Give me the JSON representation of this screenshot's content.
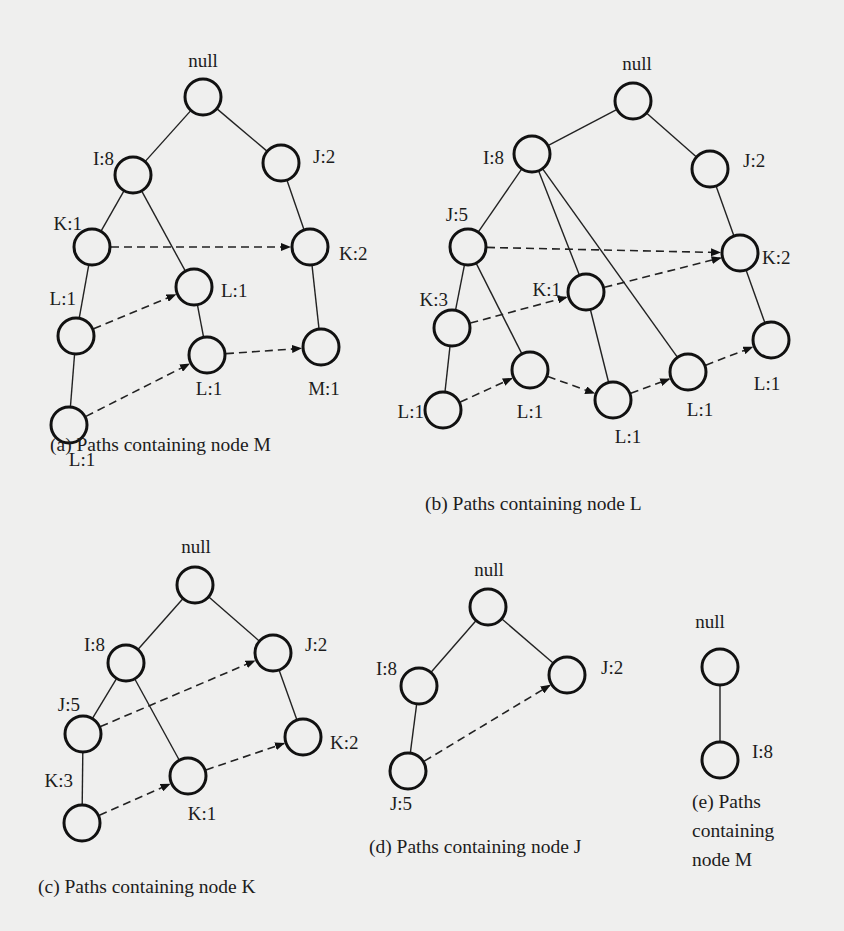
{
  "figure": {
    "background": "#efefee",
    "node_radius": 18,
    "panels": [
      {
        "id": "a",
        "caption_lines": [
          "(a) Paths containing node M"
        ],
        "caption_pos": [
          50,
          451
        ],
        "nodes": [
          {
            "id": "root",
            "label": "null",
            "x": 203,
            "y": 97,
            "lx": 203,
            "ly": 67,
            "anchor": "middle"
          },
          {
            "id": "I8",
            "label": "I:8",
            "x": 133,
            "y": 175,
            "lx": 114,
            "ly": 165,
            "anchor": "end"
          },
          {
            "id": "J2",
            "label": "J:2",
            "x": 281,
            "y": 163,
            "lx": 313,
            "ly": 163,
            "anchor": "start"
          },
          {
            "id": "K1",
            "label": "K:1",
            "x": 92,
            "y": 247,
            "lx": 82,
            "ly": 230,
            "anchor": "end"
          },
          {
            "id": "K2",
            "label": "K:2",
            "x": 310,
            "y": 247,
            "lx": 339,
            "ly": 260,
            "anchor": "start"
          },
          {
            "id": "L1m",
            "label": "L:1",
            "x": 194,
            "y": 287,
            "lx": 221,
            "ly": 297,
            "anchor": "start"
          },
          {
            "id": "L1l",
            "label": "L:1",
            "x": 76,
            "y": 336,
            "lx": 76,
            "ly": 305,
            "anchor": "end"
          },
          {
            "id": "L1lm",
            "label": "L:1",
            "x": 207,
            "y": 355,
            "lx": 209,
            "ly": 395,
            "anchor": "middle"
          },
          {
            "id": "M1",
            "label": "M:1",
            "x": 321,
            "y": 347,
            "lx": 324,
            "ly": 395,
            "anchor": "middle"
          },
          {
            "id": "L1b",
            "label": "L:1",
            "x": 69,
            "y": 425,
            "lx": 82,
            "ly": 466,
            "anchor": "middle"
          }
        ],
        "edges": [
          [
            "root",
            "I8"
          ],
          [
            "root",
            "J2"
          ],
          [
            "I8",
            "K1"
          ],
          [
            "I8",
            "L1m"
          ],
          [
            "J2",
            "K2"
          ],
          [
            "K1",
            "L1l"
          ],
          [
            "L1m",
            "L1lm"
          ],
          [
            "K2",
            "M1"
          ],
          [
            "L1l",
            "L1b"
          ]
        ],
        "links": [
          [
            "K1",
            "K2"
          ],
          [
            "L1l",
            "L1m"
          ],
          [
            "L1b",
            "L1lm"
          ],
          [
            "L1lm",
            "M1"
          ]
        ]
      },
      {
        "id": "b",
        "caption_lines": [
          "(b) Paths containing node L"
        ],
        "caption_pos": [
          425,
          510
        ],
        "nodes": [
          {
            "id": "root",
            "label": "null",
            "x": 633,
            "y": 101,
            "lx": 637,
            "ly": 70,
            "anchor": "middle"
          },
          {
            "id": "I8",
            "label": "I:8",
            "x": 532,
            "y": 154,
            "lx": 504,
            "ly": 164,
            "anchor": "end"
          },
          {
            "id": "J2",
            "label": "J:2",
            "x": 710,
            "y": 169,
            "lx": 743,
            "ly": 167,
            "anchor": "start"
          },
          {
            "id": "J5",
            "label": "J:5",
            "x": 468,
            "y": 247,
            "lx": 468,
            "ly": 221,
            "anchor": "end"
          },
          {
            "id": "K2",
            "label": "K:2",
            "x": 740,
            "y": 253,
            "lx": 762,
            "ly": 264,
            "anchor": "start"
          },
          {
            "id": "K1",
            "label": "K:1",
            "x": 586,
            "y": 292,
            "lx": 561,
            "ly": 296,
            "anchor": "end"
          },
          {
            "id": "K3",
            "label": "K:3",
            "x": 452,
            "y": 328,
            "lx": 448,
            "ly": 306,
            "anchor": "end"
          },
          {
            "id": "La",
            "label": "L:1",
            "x": 530,
            "y": 370,
            "lx": 530,
            "ly": 418,
            "anchor": "middle"
          },
          {
            "id": "Lr",
            "label": "L:1",
            "x": 771,
            "y": 340,
            "lx": 767,
            "ly": 390,
            "anchor": "middle"
          },
          {
            "id": "Lc",
            "label": "L:1",
            "x": 688,
            "y": 372,
            "lx": 700,
            "ly": 416,
            "anchor": "middle"
          },
          {
            "id": "Lb",
            "label": "L:1",
            "x": 613,
            "y": 400,
            "lx": 628,
            "ly": 443,
            "anchor": "middle"
          },
          {
            "id": "Ll",
            "label": "L:1",
            "x": 443,
            "y": 410,
            "lx": 424,
            "ly": 418,
            "anchor": "end"
          }
        ],
        "edges": [
          [
            "root",
            "I8"
          ],
          [
            "root",
            "J2"
          ],
          [
            "I8",
            "J5"
          ],
          [
            "I8",
            "K1"
          ],
          [
            "I8",
            "Lc"
          ],
          [
            "J2",
            "K2"
          ],
          [
            "J5",
            "K3"
          ],
          [
            "J5",
            "La"
          ],
          [
            "K3",
            "Ll"
          ],
          [
            "K1",
            "Lb"
          ],
          [
            "K2",
            "Lr"
          ]
        ],
        "links": [
          [
            "J5",
            "K2"
          ],
          [
            "K3",
            "K1"
          ],
          [
            "K1",
            "K2"
          ],
          [
            "Ll",
            "La"
          ],
          [
            "La",
            "Lb"
          ],
          [
            "Lb",
            "Lc"
          ],
          [
            "Lc",
            "Lr"
          ]
        ]
      },
      {
        "id": "c",
        "caption_lines": [
          "(c) Paths containing node K"
        ],
        "caption_pos": [
          38,
          893
        ],
        "nodes": [
          {
            "id": "root",
            "label": "null",
            "x": 195,
            "y": 585,
            "lx": 196,
            "ly": 553,
            "anchor": "middle"
          },
          {
            "id": "I8",
            "label": "I:8",
            "x": 126,
            "y": 663,
            "lx": 105,
            "ly": 651,
            "anchor": "end"
          },
          {
            "id": "J2",
            "label": "J:2",
            "x": 273,
            "y": 653,
            "lx": 305,
            "ly": 651,
            "anchor": "start"
          },
          {
            "id": "J5",
            "label": "J:5",
            "x": 83,
            "y": 734,
            "lx": 80,
            "ly": 711,
            "anchor": "end"
          },
          {
            "id": "K2",
            "label": "K:2",
            "x": 303,
            "y": 737,
            "lx": 330,
            "ly": 749,
            "anchor": "start"
          },
          {
            "id": "K1",
            "label": "K:1",
            "x": 188,
            "y": 776,
            "lx": 202,
            "ly": 820,
            "anchor": "middle"
          },
          {
            "id": "K3",
            "label": "K:3",
            "x": 82,
            "y": 823,
            "lx": 73,
            "ly": 787,
            "anchor": "end"
          }
        ],
        "edges": [
          [
            "root",
            "I8"
          ],
          [
            "root",
            "J2"
          ],
          [
            "I8",
            "J5"
          ],
          [
            "I8",
            "K1"
          ],
          [
            "J2",
            "K2"
          ],
          [
            "J5",
            "K3"
          ]
        ],
        "links": [
          [
            "J5",
            "J2"
          ],
          [
            "K3",
            "K1"
          ],
          [
            "K1",
            "K2"
          ]
        ]
      },
      {
        "id": "d",
        "caption_lines": [
          "(d) Paths containing node J"
        ],
        "caption_pos": [
          369,
          853
        ],
        "nodes": [
          {
            "id": "root",
            "label": "null",
            "x": 488,
            "y": 607,
            "lx": 489,
            "ly": 576,
            "anchor": "middle"
          },
          {
            "id": "I8",
            "label": "I:8",
            "x": 419,
            "y": 686,
            "lx": 397,
            "ly": 675,
            "anchor": "end"
          },
          {
            "id": "J2",
            "label": "J:2",
            "x": 567,
            "y": 675,
            "lx": 601,
            "ly": 674,
            "anchor": "start"
          },
          {
            "id": "J5",
            "label": "J:5",
            "x": 408,
            "y": 771,
            "lx": 401,
            "ly": 810,
            "anchor": "middle"
          }
        ],
        "edges": [
          [
            "root",
            "I8"
          ],
          [
            "root",
            "J2"
          ],
          [
            "I8",
            "J5"
          ]
        ],
        "links": [
          [
            "J5",
            "J2"
          ]
        ]
      },
      {
        "id": "e",
        "caption_lines": [
          "(e) Paths",
          "containing",
          "node M"
        ],
        "caption_pos": [
          692,
          808
        ],
        "nodes": [
          {
            "id": "root",
            "label": "null",
            "x": 720,
            "y": 667,
            "lx": 710,
            "ly": 628,
            "anchor": "middle"
          },
          {
            "id": "I8",
            "label": "I:8",
            "x": 720,
            "y": 760,
            "lx": 752,
            "ly": 758,
            "anchor": "start"
          }
        ],
        "edges": [
          [
            "root",
            "I8"
          ]
        ],
        "links": []
      }
    ]
  }
}
